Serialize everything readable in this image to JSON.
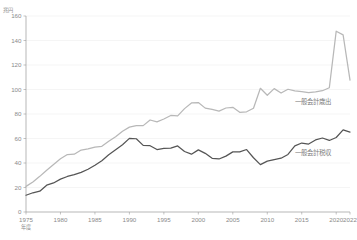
{
  "chart_data": {
    "type": "line",
    "title": "",
    "xlabel": "年度",
    "ylabel": "兆円",
    "unit_label": "兆円",
    "xlim": [
      1975,
      2022
    ],
    "ylim": [
      0,
      160
    ],
    "yticks": [
      0,
      20,
      40,
      60,
      80,
      100,
      120,
      140,
      160
    ],
    "xticks": [
      1975,
      1980,
      1985,
      1990,
      1995,
      2000,
      2005,
      2010,
      2015,
      2020,
      2022
    ],
    "grid": true,
    "legend_position": "inline-right",
    "x": [
      1975,
      1976,
      1977,
      1978,
      1979,
      1980,
      1981,
      1982,
      1983,
      1984,
      1985,
      1986,
      1987,
      1988,
      1989,
      1990,
      1991,
      1992,
      1993,
      1994,
      1995,
      1996,
      1997,
      1998,
      1999,
      2000,
      2001,
      2002,
      2003,
      2004,
      2005,
      2006,
      2007,
      2008,
      2009,
      2010,
      2011,
      2012,
      2013,
      2014,
      2015,
      2016,
      2017,
      2018,
      2019,
      2020,
      2021,
      2022
    ],
    "series": [
      {
        "name": "一般会計歳出",
        "color": "#b8b8b8",
        "values": [
          20.9,
          24.5,
          29.1,
          34.1,
          38.8,
          43.4,
          46.9,
          47.2,
          50.6,
          51.5,
          53.0,
          53.6,
          57.7,
          61.5,
          65.9,
          69.3,
          70.5,
          70.5,
          75.1,
          73.6,
          75.9,
          78.8,
          78.5,
          84.4,
          89.0,
          89.3,
          84.8,
          83.7,
          82.4,
          84.9,
          85.5,
          81.4,
          81.8,
          84.7,
          101.0,
          95.3,
          100.7,
          97.1,
          100.2,
          98.8,
          98.2,
          97.5,
          98.1,
          99.0,
          101.4,
          147.6,
          144.6,
          107.6
        ]
      },
      {
        "name": "一般会計税収",
        "color": "#555555",
        "values": [
          13.7,
          15.7,
          17.0,
          21.9,
          23.7,
          26.8,
          29.0,
          30.5,
          32.4,
          34.9,
          38.2,
          41.9,
          46.8,
          50.8,
          54.9,
          60.1,
          59.8,
          54.4,
          54.1,
          51.0,
          51.9,
          52.1,
          53.9,
          49.4,
          47.2,
          50.7,
          47.9,
          43.8,
          43.3,
          45.6,
          49.1,
          49.1,
          51.0,
          44.3,
          38.7,
          41.5,
          42.8,
          43.9,
          47.0,
          54.0,
          56.3,
          55.5,
          58.8,
          60.4,
          58.4,
          60.8,
          67.0,
          65.2
        ]
      }
    ],
    "annotations": [
      {
        "text": "一般会計歳出",
        "x": 2014,
        "y": 90
      },
      {
        "text": "一般会計税収",
        "x": 2014,
        "y": 48
      }
    ]
  }
}
